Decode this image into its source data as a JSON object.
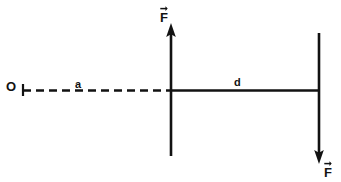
{
  "figure": {
    "background_color": "#ffffff",
    "stroke_color": "#121212",
    "type": "physics-force-diagram",
    "origin": {
      "label": "O",
      "x": 9,
      "y": 90,
      "tick_x": 23,
      "tick_half_height": 6
    },
    "segments": [
      {
        "name": "distance-a",
        "label": "a",
        "style": "dashed",
        "x_start": 23,
        "x_end": 171,
        "y": 90,
        "label_x": 78,
        "label_y": 84
      },
      {
        "name": "distance-d",
        "label": "d",
        "style": "solid",
        "x_start": 171,
        "x_end": 319,
        "y": 90,
        "label_x": 237,
        "label_y": 82
      }
    ],
    "force_vectors": [
      {
        "name": "force-up",
        "label": "F",
        "direction": "up",
        "x": 171,
        "y_tail": 156,
        "y_head": 24,
        "label_x": 166,
        "label_y": 17
      },
      {
        "name": "force-down",
        "label": "F",
        "direction": "down",
        "x": 319,
        "y_tail": 33,
        "y_head": 163,
        "label_x": 330,
        "label_y": 172
      }
    ]
  }
}
